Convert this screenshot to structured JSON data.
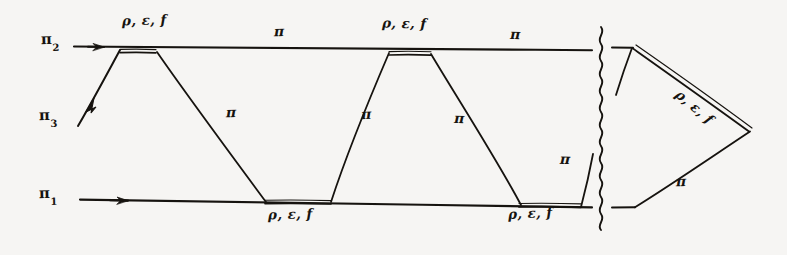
{
  "figure": {
    "type": "diagram",
    "style": "hand-drawn multiperipheral / Feynman-like exchange diagram",
    "background_color": "#f6f5f3",
    "ink_color": "#16130f",
    "external_lines": [
      {
        "id": "pi2",
        "base": "π",
        "sub": "2",
        "label_x": 48,
        "label_y": 33,
        "position": "top-left",
        "arrow": "left"
      },
      {
        "id": "pi3",
        "base": "π",
        "sub": "3",
        "label_x": 45,
        "label_y": 110,
        "position": "mid-left",
        "arrow": "down-left"
      },
      {
        "id": "pi1",
        "base": "π",
        "sub": "1",
        "label_x": 45,
        "label_y": 188,
        "position": "bottom-left",
        "arrow": "left"
      }
    ],
    "exchange_labels": [
      {
        "text": "π",
        "x": 278,
        "y": 30,
        "on": "top-line-segment-1",
        "tilt": "tilt-a"
      },
      {
        "text": "π",
        "x": 514,
        "y": 32,
        "on": "top-line-segment-2",
        "tilt": "tilt-b"
      },
      {
        "text": "π",
        "x": 229,
        "y": 110,
        "on": "diagonal-1",
        "tilt": "tilt-a"
      },
      {
        "text": "π",
        "x": 364,
        "y": 112,
        "on": "diagonal-2",
        "tilt": "tilt-c"
      },
      {
        "text": "π",
        "x": 457,
        "y": 116,
        "on": "diagonal-3",
        "tilt": "tilt-b"
      },
      {
        "text": "π",
        "x": 563,
        "y": 157,
        "on": "diagonal-4",
        "tilt": "tilt-d"
      },
      {
        "text": "π",
        "x": 679,
        "y": 180,
        "on": "triangle-lower-leg",
        "tilt": "tilt-a"
      }
    ],
    "vertex_labels": [
      {
        "text": "ρ, ε, f",
        "x": 130,
        "y": 19,
        "attaches_to": "top-vertex-1",
        "tilt": "tilt-a"
      },
      {
        "text": "ρ, ε, f",
        "x": 390,
        "y": 22,
        "attaches_to": "top-vertex-2",
        "tilt": "tilt-b"
      },
      {
        "text": "ρ, ε, f",
        "x": 276,
        "y": 213,
        "attaches_to": "bottom-vertex-1",
        "tilt": "tilt-a"
      },
      {
        "text": "ρ, ε, f",
        "x": 516,
        "y": 212,
        "attaches_to": "bottom-vertex-2",
        "tilt": "tilt-c"
      },
      {
        "text": "ρ, ε, f",
        "x": 694,
        "y": 95,
        "attaches_to": "triangle-upper-leg",
        "tilt": "tilt-d",
        "rotate": -38
      }
    ],
    "cut_line": {
      "kind": "wavy-vertical",
      "x": 601,
      "y_top": 27,
      "y_bottom": 233
    },
    "geometry": {
      "top_line": {
        "x1": 74,
        "y1": 47,
        "x2": 592,
        "y2": 50
      },
      "bottom_line": {
        "x1": 80,
        "y1": 200,
        "x2": 592,
        "y2": 207
      },
      "top_vertices": [
        {
          "x1": 120,
          "x2": 156,
          "y": 49
        },
        {
          "x1": 389,
          "x2": 430,
          "y": 50
        }
      ],
      "bottom_vertices": [
        {
          "x1": 264,
          "x2": 330,
          "y": 203
        },
        {
          "x1": 519,
          "x2": 580,
          "y": 206
        }
      ],
      "diagonals": [
        {
          "x1": 120,
          "y1": 49,
          "x2": 78,
          "y2": 126,
          "arrow": true,
          "name": "pi3-leg"
        },
        {
          "x1": 156,
          "y1": 50,
          "x2": 266,
          "y2": 203,
          "arrow": false,
          "name": "diagonal-1"
        },
        {
          "x1": 389,
          "y1": 51,
          "x2": 330,
          "y2": 203,
          "arrow": false,
          "name": "diagonal-2"
        },
        {
          "x1": 430,
          "y1": 52,
          "x2": 521,
          "y2": 206,
          "arrow": false,
          "name": "diagonal-3"
        },
        {
          "x1": 581,
          "y1": 207,
          "x2": 592,
          "y2": 155,
          "arrow": false,
          "name": "diagonal-4"
        }
      ],
      "triangle": {
        "top_stub": {
          "x1": 612,
          "y1": 48,
          "x2": 632,
          "y2": 48
        },
        "bottom_stub": {
          "x1": 612,
          "y1": 207,
          "x2": 634,
          "y2": 207
        },
        "inner_leg": {
          "x1": 632,
          "y1": 48,
          "x2": 616,
          "y2": 95
        },
        "upper_double": {
          "x1": 632,
          "y1": 48,
          "x2": 749,
          "y2": 130
        },
        "lower_leg": {
          "x1": 749,
          "y1": 131,
          "x2": 634,
          "y2": 207
        }
      }
    }
  }
}
